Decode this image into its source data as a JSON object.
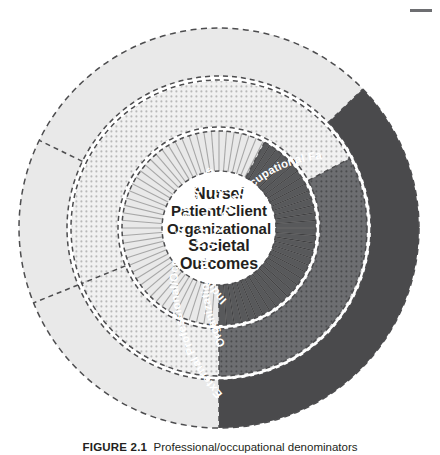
{
  "figure": {
    "center_lines": [
      "Nurse/",
      "Patient/Client",
      "Organizational",
      "Societal",
      "Outcomes"
    ],
    "rings": [
      {
        "id": "inner",
        "label": "Individual Nurse Factors",
        "texture": "radial-stripes",
        "light_fill": "#e9e9e9",
        "dark_fill": "#58595b"
      },
      {
        "id": "middle",
        "label": "Organizational Professional/Occupational Factors",
        "texture": "dots",
        "light_fill": "#e6e6e6",
        "dark_fill": "#6d6e71"
      },
      {
        "id": "outer",
        "label": "External Professional/Occupational Factors",
        "texture": "solid",
        "light_fill": "#e9e9e9",
        "dark_fill": "#4a4a4c"
      }
    ],
    "caption_number": "FIGURE 2.1",
    "caption_text": "Professional/occupational denominators",
    "colors": {
      "text": "#231f20",
      "label_text": "#ffffff",
      "dashed_border": "#4d4d4f",
      "background": "#ffffff",
      "corner_mark": "#6d6e71"
    }
  }
}
